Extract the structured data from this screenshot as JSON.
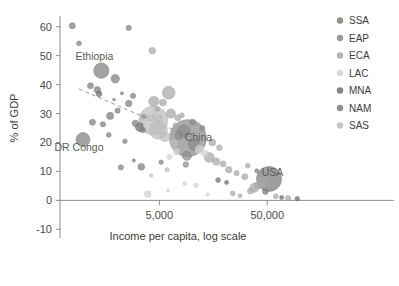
{
  "chart_data": {
    "type": "scatter",
    "title": "",
    "xlabel": "Income per capita, log scale",
    "ylabel": "% of GDP",
    "xscale": "log",
    "xticks": [
      5000,
      50000
    ],
    "xtick_labels": [
      "5,000",
      "50,000"
    ],
    "yticks": [
      -10,
      0,
      10,
      20,
      30,
      40,
      50,
      60
    ],
    "ytick_labels": [
      "-10",
      "0",
      "10",
      "20",
      "30",
      "40",
      "50",
      "60"
    ],
    "ylim": [
      -13,
      63
    ],
    "xlim": [
      600,
      130000
    ],
    "grid": false,
    "legend_position": "right",
    "bubble_note": "marker area encodes population",
    "legend": [
      {
        "key": "SSA",
        "label": "SSA",
        "color": "#7f7f7f"
      },
      {
        "key": "EAP",
        "label": "EAP",
        "color": "#8a8a8a"
      },
      {
        "key": "ECA",
        "label": "ECA",
        "color": "#a8a8a8"
      },
      {
        "key": "LAC",
        "label": "LAC",
        "color": "#d2d2d2"
      },
      {
        "key": "MNA",
        "label": "MNA",
        "color": "#6e6e6e"
      },
      {
        "key": "NAM",
        "label": "NAM",
        "color": "#7a7a7a"
      },
      {
        "key": "SAS",
        "label": "SAS",
        "color": "#bdbdbd"
      }
    ],
    "trend_line": {
      "style": "dashed",
      "x_start": 900,
      "y_start": 38.5,
      "x_end": 11000,
      "y_end": 21.0
    },
    "annotations": [
      {
        "text": "Ethiopia",
        "x": 1250,
        "y": 48.5,
        "style": "dark"
      },
      {
        "text": "DR Congo",
        "x": 900,
        "y": 17.0,
        "style": "dark"
      },
      {
        "text": "India",
        "x": 4200,
        "y": 27.5,
        "style": "light"
      },
      {
        "text": "China",
        "x": 11500,
        "y": 20.5,
        "style": "dark"
      },
      {
        "text": "USA",
        "x": 56000,
        "y": 8.5,
        "style": "dark"
      }
    ],
    "points": [
      {
        "x": 780,
        "y": 60.3,
        "r": 3.0,
        "group": "SSA"
      },
      {
        "x": 900,
        "y": 54.2,
        "r": 2.4,
        "group": "SSA"
      },
      {
        "x": 2600,
        "y": 59.6,
        "r": 2.6,
        "group": "SSA"
      },
      {
        "x": 4300,
        "y": 51.7,
        "r": 3.3,
        "group": "ECA"
      },
      {
        "x": 1450,
        "y": 44.8,
        "r": 7.6,
        "group": "SSA"
      },
      {
        "x": 1950,
        "y": 42.0,
        "r": 4.2,
        "group": "SSA"
      },
      {
        "x": 1150,
        "y": 39.6,
        "r": 3.0,
        "group": "SSA"
      },
      {
        "x": 1330,
        "y": 38.2,
        "r": 3.2,
        "group": "SSA"
      },
      {
        "x": 1380,
        "y": 36.8,
        "r": 2.8,
        "group": "MNA"
      },
      {
        "x": 2250,
        "y": 37.0,
        "r": 1.6,
        "group": "SSA"
      },
      {
        "x": 2850,
        "y": 36.1,
        "r": 2.6,
        "group": "SSA"
      },
      {
        "x": 6100,
        "y": 37.2,
        "r": 6.4,
        "group": "ECA"
      },
      {
        "x": 4450,
        "y": 34.2,
        "r": 5.2,
        "group": "ECA"
      },
      {
        "x": 5400,
        "y": 33.8,
        "r": 3.4,
        "group": "ECA"
      },
      {
        "x": 2600,
        "y": 33.5,
        "r": 3.2,
        "group": "SSA"
      },
      {
        "x": 2050,
        "y": 31.0,
        "r": 2.6,
        "group": "SSA"
      },
      {
        "x": 1750,
        "y": 29.2,
        "r": 3.6,
        "group": "SSA"
      },
      {
        "x": 1200,
        "y": 27.0,
        "r": 3.0,
        "group": "SSA"
      },
      {
        "x": 1500,
        "y": 26.3,
        "r": 2.6,
        "group": "SSA"
      },
      {
        "x": 6400,
        "y": 30.0,
        "r": 4.6,
        "group": "ECA"
      },
      {
        "x": 7400,
        "y": 28.5,
        "r": 3.0,
        "group": "ECA"
      },
      {
        "x": 8100,
        "y": 29.4,
        "r": 2.4,
        "group": "ECA"
      },
      {
        "x": 3000,
        "y": 26.6,
        "r": 3.2,
        "group": "SSA"
      },
      {
        "x": 3300,
        "y": 25.3,
        "r": 4.4,
        "group": "MNA"
      },
      {
        "x": 3500,
        "y": 24.4,
        "r": 3.0,
        "group": "SSA"
      },
      {
        "x": 3750,
        "y": 25.8,
        "r": 2.4,
        "group": "LAC"
      },
      {
        "x": 980,
        "y": 21.0,
        "r": 7.0,
        "group": "SSA"
      },
      {
        "x": 1700,
        "y": 22.6,
        "r": 2.4,
        "group": "SSA"
      },
      {
        "x": 2400,
        "y": 20.4,
        "r": 2.2,
        "group": "SSA"
      },
      {
        "x": 4400,
        "y": 27.6,
        "r": 14.5,
        "group": "SAS"
      },
      {
        "x": 4900,
        "y": 24.2,
        "r": 9.0,
        "group": "SAS"
      },
      {
        "x": 5600,
        "y": 22.0,
        "r": 5.0,
        "group": "SAS"
      },
      {
        "x": 9200,
        "y": 21.5,
        "r": 18.5,
        "group": "EAP"
      },
      {
        "x": 8400,
        "y": 24.0,
        "r": 6.2,
        "group": "EAP"
      },
      {
        "x": 7600,
        "y": 22.4,
        "r": 4.0,
        "group": "EAP"
      },
      {
        "x": 10500,
        "y": 19.2,
        "r": 5.6,
        "group": "EAP"
      },
      {
        "x": 11800,
        "y": 17.6,
        "r": 4.2,
        "group": "LAC"
      },
      {
        "x": 13200,
        "y": 16.2,
        "r": 3.4,
        "group": "LAC"
      },
      {
        "x": 9000,
        "y": 15.4,
        "r": 4.6,
        "group": "EAP"
      },
      {
        "x": 7200,
        "y": 16.8,
        "r": 3.2,
        "group": "LAC"
      },
      {
        "x": 6200,
        "y": 15.0,
        "r": 2.6,
        "group": "LAC"
      },
      {
        "x": 14500,
        "y": 14.8,
        "r": 5.0,
        "group": "ECA"
      },
      {
        "x": 16800,
        "y": 13.4,
        "r": 3.6,
        "group": "ECA"
      },
      {
        "x": 19500,
        "y": 12.6,
        "r": 3.0,
        "group": "ECA"
      },
      {
        "x": 2200,
        "y": 11.4,
        "r": 2.6,
        "group": "SSA"
      },
      {
        "x": 3400,
        "y": 11.6,
        "r": 3.4,
        "group": "SSA"
      },
      {
        "x": 4200,
        "y": 8.6,
        "r": 1.8,
        "group": "SAS"
      },
      {
        "x": 3900,
        "y": 2.2,
        "r": 3.4,
        "group": "LAC"
      },
      {
        "x": 6000,
        "y": 3.4,
        "r": 1.6,
        "group": "LAC"
      },
      {
        "x": 8600,
        "y": 5.8,
        "r": 2.0,
        "group": "LAC"
      },
      {
        "x": 11000,
        "y": 5.2,
        "r": 2.2,
        "group": "LAC"
      },
      {
        "x": 22000,
        "y": 10.6,
        "r": 3.2,
        "group": "ECA"
      },
      {
        "x": 26000,
        "y": 9.4,
        "r": 2.6,
        "group": "ECA"
      },
      {
        "x": 31000,
        "y": 8.2,
        "r": 3.0,
        "group": "ECA"
      },
      {
        "x": 17500,
        "y": 7.0,
        "r": 2.4,
        "group": "MNA"
      },
      {
        "x": 21000,
        "y": 6.2,
        "r": 2.0,
        "group": "MNA"
      },
      {
        "x": 52000,
        "y": 7.4,
        "r": 12.5,
        "group": "NAM"
      },
      {
        "x": 45000,
        "y": 6.4,
        "r": 5.0,
        "group": "ECA"
      },
      {
        "x": 41000,
        "y": 5.2,
        "r": 3.6,
        "group": "ECA"
      },
      {
        "x": 38000,
        "y": 4.4,
        "r": 4.6,
        "group": "ECA"
      },
      {
        "x": 35000,
        "y": 3.2,
        "r": 3.0,
        "group": "ECA"
      },
      {
        "x": 48000,
        "y": 3.0,
        "r": 2.8,
        "group": "NAM"
      },
      {
        "x": 60000,
        "y": 1.4,
        "r": 2.4,
        "group": "ECA"
      },
      {
        "x": 68000,
        "y": 1.0,
        "r": 2.0,
        "group": "MNA"
      },
      {
        "x": 78000,
        "y": 0.8,
        "r": 2.6,
        "group": "ECA"
      },
      {
        "x": 95000,
        "y": 0.6,
        "r": 2.2,
        "group": "MNA"
      },
      {
        "x": 28000,
        "y": 1.6,
        "r": 2.0,
        "group": "ECA"
      },
      {
        "x": 24000,
        "y": 2.4,
        "r": 2.4,
        "group": "ECA"
      },
      {
        "x": 14000,
        "y": 2.0,
        "r": 1.8,
        "group": "LAC"
      },
      {
        "x": 5200,
        "y": 13.2,
        "r": 2.2,
        "group": "SSA"
      },
      {
        "x": 2900,
        "y": 13.8,
        "r": 1.6,
        "group": "SSA"
      },
      {
        "x": 1900,
        "y": 34.8,
        "r": 1.4,
        "group": "SSA"
      },
      {
        "x": 3600,
        "y": 29.0,
        "r": 2.0,
        "group": "SSA"
      },
      {
        "x": 4800,
        "y": 31.5,
        "r": 2.4,
        "group": "ECA"
      },
      {
        "x": 10200,
        "y": 27.0,
        "r": 3.0,
        "group": "EAP"
      },
      {
        "x": 12500,
        "y": 25.0,
        "r": 2.6,
        "group": "EAP"
      },
      {
        "x": 7000,
        "y": 26.0,
        "r": 2.2,
        "group": "ECA"
      },
      {
        "x": 15500,
        "y": 20.0,
        "r": 3.4,
        "group": "ECA"
      },
      {
        "x": 18000,
        "y": 18.2,
        "r": 2.8,
        "group": "ECA"
      },
      {
        "x": 6800,
        "y": 19.6,
        "r": 3.8,
        "group": "SAS"
      },
      {
        "x": 8800,
        "y": 12.4,
        "r": 2.8,
        "group": "EAP"
      },
      {
        "x": 5900,
        "y": 10.6,
        "r": 2.2,
        "group": "SAS"
      },
      {
        "x": 33000,
        "y": 12.0,
        "r": 2.4,
        "group": "ECA"
      },
      {
        "x": 40000,
        "y": 10.2,
        "r": 2.0,
        "group": "NAM"
      }
    ]
  }
}
